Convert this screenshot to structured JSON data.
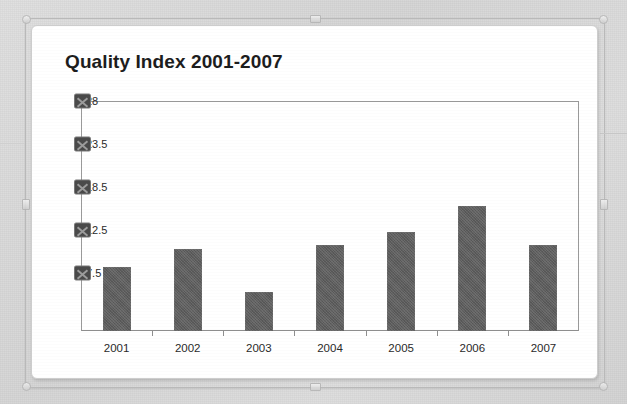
{
  "chart_data": {
    "type": "bar",
    "title": "Quality Index 2001-2007",
    "xlabel": "",
    "ylabel": "",
    "categories": [
      "2001",
      "2002",
      "2003",
      "2004",
      "2005",
      "2006",
      "2007"
    ],
    "values": [
      7.5,
      9.5,
      4.5,
      10,
      11.5,
      14.5,
      10
    ],
    "ytick_labels": [
      "28",
      "23.5",
      "18.5",
      "12.5",
      "7.5"
    ],
    "ytick_values": [
      28,
      23.5,
      18.5,
      12.5,
      7.5
    ],
    "ylim": [
      0,
      28
    ],
    "grid": false,
    "legend": "none",
    "series": [
      {
        "name": "Quality Index",
        "values": [
          7.5,
          9.5,
          4.5,
          10,
          11.5,
          14.5,
          10
        ]
      }
    ],
    "bar_color": "#5e5e5e"
  },
  "colors": {
    "bar": "#5e5e5e",
    "axis": "#8e8e8e",
    "title": "#1d1d1d",
    "card": "#ffffff",
    "page_background": "#d8d8d8",
    "selection_frame": "#b9b9b9"
  },
  "icons": {
    "handle_top": "resize-handle",
    "handle_bottom": "resize-handle",
    "handle_left": "resize-handle",
    "handle_right": "resize-handle",
    "corner": "corner-resize-handle",
    "axis_marker": "axis-selection-marker"
  }
}
